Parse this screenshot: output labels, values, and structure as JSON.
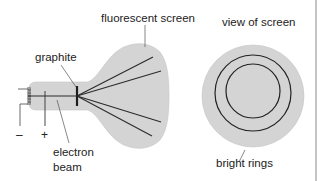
{
  "diagram": {
    "labels": {
      "fluorescent_screen": "fluorescent screen",
      "graphite": "graphite",
      "electron_beam_line1": "electron",
      "electron_beam_line2": "beam",
      "view_of_screen": "view of screen",
      "bright_rings": "bright rings",
      "minus": "–",
      "plus": "+"
    },
    "colors": {
      "tube_fill": "#d4d4d4",
      "line": "#2a2a2a",
      "leader": "#555555",
      "border": "#8a8a8a"
    }
  }
}
